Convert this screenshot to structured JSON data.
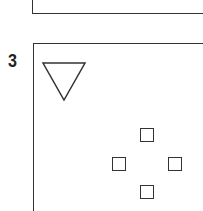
{
  "panels": [
    {
      "label": "",
      "position": "top-partial"
    },
    {
      "label": "3",
      "shapes": {
        "triangle": {
          "orientation": "down",
          "outline": true
        },
        "squares": [
          {
            "position": "top"
          },
          {
            "position": "left"
          },
          {
            "position": "right"
          },
          {
            "position": "bottom"
          }
        ]
      }
    }
  ],
  "colors": {
    "stroke": "#333333",
    "background": "#ffffff"
  }
}
